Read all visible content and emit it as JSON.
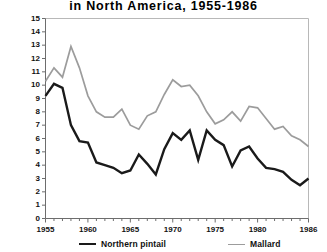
{
  "chart_data": {
    "type": "line",
    "title": "in North America, 1955-1986",
    "xlabel": "",
    "ylabel": "",
    "xlim": [
      1955,
      1986
    ],
    "ylim": [
      0,
      15
    ],
    "grid": false,
    "legend_position": "bottom",
    "y_ticks": [
      "0",
      "1",
      "2",
      "3",
      "4",
      "5",
      "6",
      "7",
      "8",
      "9",
      "10",
      "11",
      "12",
      "13",
      "14",
      "15"
    ],
    "x_ticks": [
      "1955",
      "1960",
      "1965",
      "1970",
      "1975",
      "1980",
      "1986"
    ],
    "x_tick_values": [
      1955,
      1960,
      1965,
      1970,
      1975,
      1980,
      1986
    ],
    "x": [
      1955,
      1956,
      1957,
      1958,
      1959,
      1960,
      1961,
      1962,
      1963,
      1964,
      1965,
      1966,
      1967,
      1968,
      1969,
      1970,
      1971,
      1972,
      1973,
      1974,
      1975,
      1976,
      1977,
      1978,
      1979,
      1980,
      1981,
      1982,
      1983,
      1984,
      1985,
      1986
    ],
    "series": [
      {
        "name": "Northern pintail",
        "color": "#1a1a1a",
        "values": [
          9.2,
          10.1,
          9.8,
          7.0,
          5.8,
          5.7,
          4.2,
          4.0,
          3.8,
          3.4,
          3.6,
          4.8,
          4.1,
          3.3,
          5.2,
          6.4,
          5.9,
          6.6,
          4.4,
          6.6,
          5.9,
          5.5,
          3.9,
          5.1,
          5.4,
          4.5,
          3.8,
          3.7,
          3.5,
          2.9,
          2.5,
          3.0
        ]
      },
      {
        "name": "Mallard",
        "color": "#9c9c9c",
        "values": [
          10.3,
          11.3,
          10.6,
          12.9,
          11.3,
          9.2,
          8.0,
          7.6,
          7.6,
          8.2,
          7.0,
          6.7,
          7.7,
          8.0,
          9.3,
          10.4,
          9.9,
          10.0,
          9.2,
          8.0,
          7.1,
          7.4,
          8.0,
          7.3,
          8.4,
          8.3,
          7.5,
          6.7,
          6.9,
          6.2,
          5.9,
          5.4
        ]
      }
    ]
  }
}
